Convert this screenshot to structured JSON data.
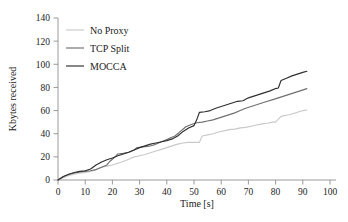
{
  "chart_data": {
    "type": "line",
    "title": "",
    "subtitle": "",
    "xlabel": "Time [s]",
    "ylabel": "Kbytes received",
    "xlim": [
      0,
      100
    ],
    "ylim": [
      0,
      140
    ],
    "xticks": [
      0,
      10,
      20,
      30,
      40,
      50,
      60,
      70,
      80,
      90,
      100
    ],
    "yticks": [
      0,
      20,
      40,
      60,
      80,
      100,
      120,
      140
    ],
    "grid": false,
    "legend_position": "top-left",
    "colors": {
      "no_proxy": "#c9c9c9",
      "tcp_split": "#6f6f6f",
      "mocca": "#2f2f2f",
      "axis": "#8e8e8e",
      "text": "#1a1a1a",
      "background": "#ffffff"
    },
    "series": [
      {
        "name": "No Proxy",
        "color": "#c9c9c9",
        "x": [
          0,
          2,
          4,
          6,
          8,
          10,
          12,
          14,
          16,
          18,
          20,
          22,
          24,
          26,
          28,
          30,
          32,
          34,
          36,
          38,
          40,
          42,
          44,
          46,
          48,
          50,
          52,
          53,
          55,
          57,
          59,
          61,
          63,
          65,
          67,
          69,
          71,
          73,
          75,
          77,
          79,
          80,
          82,
          84,
          86,
          88,
          90,
          91.5
        ],
        "y": [
          0,
          2,
          4,
          5,
          6,
          6.5,
          7.5,
          9,
          11,
          12,
          13,
          14.5,
          16,
          18,
          20,
          21,
          22,
          23.5,
          25,
          26.5,
          28,
          29.5,
          31,
          32,
          32.5,
          32.5,
          32.5,
          38,
          39,
          40,
          41.5,
          42.5,
          43.5,
          44,
          45,
          45.5,
          46.5,
          47.5,
          48.5,
          49,
          50,
          50,
          55,
          56,
          57,
          58.5,
          60,
          60.5
        ]
      },
      {
        "name": "TCP Split",
        "color": "#6f6f6f",
        "x": [
          0,
          2,
          4,
          6,
          8,
          10,
          12,
          14,
          16,
          18,
          19,
          21,
          22,
          24,
          26,
          28,
          29,
          31,
          33,
          35,
          37,
          39,
          41,
          43,
          45,
          47,
          49,
          51,
          53,
          55,
          57,
          59,
          61,
          63,
          65,
          67,
          69,
          71,
          73,
          75,
          77,
          79,
          81,
          83,
          85,
          87,
          89,
          91.5
        ],
        "y": [
          0,
          3,
          5,
          6,
          7,
          7.5,
          8,
          9,
          11,
          13,
          16,
          20,
          22.5,
          23,
          24,
          26,
          28,
          28.5,
          29,
          30,
          32,
          34,
          36,
          38,
          42,
          46,
          48,
          49.5,
          50,
          51,
          52,
          53.5,
          55,
          56.5,
          58,
          60,
          62,
          63.5,
          65,
          66.5,
          68,
          69.5,
          71,
          72.5,
          74,
          75.5,
          77,
          79
        ]
      },
      {
        "name": "MOCCA",
        "color": "#2f2f2f",
        "x": [
          0,
          2,
          4,
          6,
          8,
          10,
          12,
          14,
          16,
          18,
          20,
          22,
          24,
          26,
          28,
          30,
          32,
          34,
          36,
          38,
          40,
          42,
          44,
          46,
          48,
          50,
          51,
          52,
          54,
          56,
          58,
          60,
          62,
          64,
          66,
          68,
          70,
          72,
          74,
          76,
          78,
          80,
          81,
          82,
          84,
          86,
          88,
          90,
          91.5
        ],
        "y": [
          0,
          3,
          5,
          6.5,
          7.5,
          8,
          9.5,
          13,
          15.5,
          17.5,
          19,
          21,
          22.5,
          24,
          26,
          28,
          29.5,
          31,
          32,
          33,
          34,
          35.5,
          38,
          42,
          45,
          47,
          52,
          58.5,
          59,
          60,
          62,
          63.5,
          65,
          66.5,
          68,
          68.5,
          71,
          72.5,
          74,
          75.5,
          77,
          79,
          79.5,
          86,
          88,
          90,
          91.5,
          93,
          94
        ]
      }
    ]
  },
  "legend": {
    "items": [
      {
        "label": "No Proxy"
      },
      {
        "label": "TCP Split"
      },
      {
        "label": "MOCCA"
      }
    ]
  }
}
